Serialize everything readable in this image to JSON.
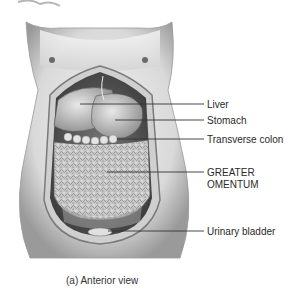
{
  "figure": {
    "caption": "(a) Anterior view",
    "labels": [
      {
        "id": "liver",
        "text": "Liver"
      },
      {
        "id": "stomach",
        "text": "Stomach"
      },
      {
        "id": "transverse-colon",
        "text": "Transverse colon"
      },
      {
        "id": "greater-omentum-1",
        "text": "GREATER"
      },
      {
        "id": "greater-omentum-2",
        "text": "OMENTUM"
      },
      {
        "id": "urinary-bladder",
        "text": "Urinary bladder"
      }
    ]
  }
}
